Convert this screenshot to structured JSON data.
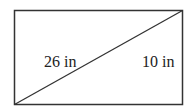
{
  "diagram": {
    "shape": "rectangle-with-diagonal",
    "labels": {
      "diagonal": "26 in",
      "height": "10 in"
    },
    "colors": {
      "stroke": "#333333",
      "text": "#222222",
      "background": "#ffffff"
    }
  }
}
